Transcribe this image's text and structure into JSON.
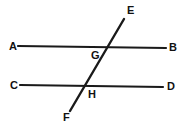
{
  "figure": {
    "type": "geometry-diagram",
    "background_color": "#ffffff",
    "stroke_color": "#1a1a1a",
    "label_color": "#111111",
    "width": 184,
    "height": 130
  },
  "lines": [
    {
      "name": "line-ab",
      "from_label": "A",
      "to_label": "B",
      "x1": 18,
      "y1": 46,
      "x2": 166,
      "y2": 48,
      "stroke_width": 2.2
    },
    {
      "name": "line-cd",
      "from_label": "C",
      "to_label": "D",
      "x1": 20,
      "y1": 85,
      "x2": 163,
      "y2": 87,
      "stroke_width": 2.2
    },
    {
      "name": "line-ef-transversal",
      "from_label": "E",
      "to_label": "F",
      "x1": 124,
      "y1": 19,
      "x2": 70,
      "y2": 111,
      "stroke_width": 2.4
    }
  ],
  "intersections": [
    {
      "name": "point-g",
      "label": "G",
      "x": 106,
      "y": 47
    },
    {
      "name": "point-h",
      "label": "H",
      "x": 85,
      "y": 86
    }
  ],
  "labels": {
    "a": {
      "text": "A",
      "left": 9,
      "top": 41
    },
    "b": {
      "text": "B",
      "left": 169,
      "top": 42
    },
    "c": {
      "text": "C",
      "left": 10,
      "top": 80
    },
    "d": {
      "text": "D",
      "left": 167,
      "top": 81
    },
    "e": {
      "text": "E",
      "left": 127,
      "top": 5
    },
    "f": {
      "text": "F",
      "left": 63,
      "top": 112
    },
    "g": {
      "text": "G",
      "left": 91,
      "top": 50
    },
    "h": {
      "text": "H",
      "left": 88,
      "top": 89
    }
  }
}
